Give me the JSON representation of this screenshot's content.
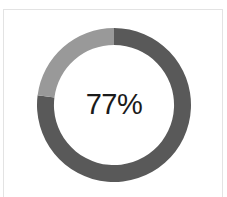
{
  "card": {
    "clipped_heading_text": "",
    "background": "#ffffff",
    "border_color": "#e3e3e3"
  },
  "chart_data": {
    "type": "pie",
    "variant": "donut",
    "title": "",
    "subtitle": "",
    "xlabel": "",
    "ylabel": "",
    "grid": false,
    "legend": "none",
    "center_label": "77%",
    "units": "%",
    "start_angle_deg": 0,
    "direction": "clockwise",
    "inner_radius_ratio": 0.78,
    "categories": [
      "Completed",
      "Remaining"
    ],
    "values": [
      77,
      23
    ],
    "colors": [
      "#595959",
      "#999999"
    ],
    "slices": [
      {
        "name": "Completed",
        "value": 77,
        "color": "#595959",
        "start_deg": 0,
        "end_deg": 277.2
      },
      {
        "name": "Remaining",
        "value": 23,
        "color": "#999999",
        "start_deg": 277.2,
        "end_deg": 360
      }
    ],
    "total": 100,
    "text_color": "#1a1a1a"
  }
}
